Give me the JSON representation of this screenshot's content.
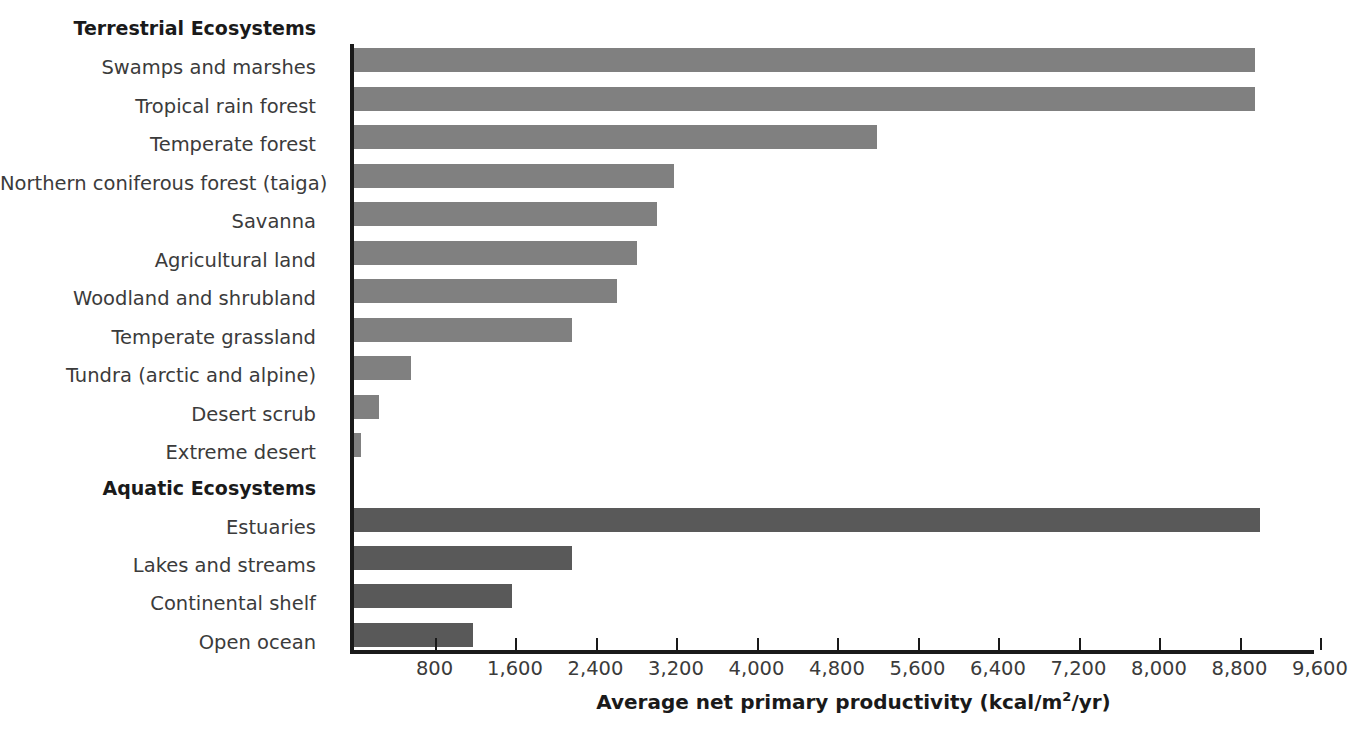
{
  "chart_data": {
    "type": "bar",
    "orientation": "horizontal",
    "title": "",
    "xlabel": "Average net primary productivity (kcal/m2/yr)",
    "xlabel_prefix": "Average net primary productivity (kcal/m",
    "xlabel_sup": "2",
    "xlabel_suffix": "/yr)",
    "ylabel": "",
    "xlim": [
      0,
      9600
    ],
    "grid": false,
    "legend": "none",
    "tick_values": [
      800,
      1600,
      2400,
      3200,
      4000,
      4800,
      5600,
      6400,
      7200,
      8000,
      8800,
      9600
    ],
    "tick_labels": [
      "800",
      "1,600",
      "2,400",
      "3,200",
      "4,000",
      "4,800",
      "5,600",
      "6,400",
      "7,200",
      "8,000",
      "8,800",
      "9,600"
    ],
    "groups": [
      {
        "name": "Terrestrial Ecosystems",
        "color": "#808080",
        "categories": [
          "Swamps and marshes",
          "Tropical rain forest",
          "Temperate forest",
          "Northern coniferous forest (taiga)",
          "Savanna",
          "Agricultural land",
          "Woodland and shrubland",
          "Temperate grassland",
          "Tundra (arctic and alpine)",
          "Desert scrub",
          "Extreme desert"
        ],
        "values": [
          8950,
          8950,
          5200,
          3180,
          3010,
          2810,
          2615,
          2170,
          570,
          250,
          70
        ]
      },
      {
        "name": "Aquatic Ecosystems",
        "color": "#595959",
        "categories": [
          "Estuaries",
          "Lakes and streams",
          "Continental shelf",
          "Open ocean"
        ],
        "values": [
          9000,
          2170,
          1570,
          1180
        ]
      }
    ],
    "categories": [
      "Swamps and marshes",
      "Tropical rain forest",
      "Temperate forest",
      "Northern coniferous forest (taiga)",
      "Savanna",
      "Agricultural land",
      "Woodland and shrubland",
      "Temperate grassland",
      "Tundra (arctic and alpine)",
      "Desert scrub",
      "Extreme desert",
      "Estuaries",
      "Lakes and streams",
      "Continental shelf",
      "Open ocean"
    ],
    "values": [
      8950,
      8950,
      5200,
      3180,
      3010,
      2810,
      2615,
      2170,
      570,
      250,
      70,
      9000,
      2170,
      1570,
      1180
    ]
  },
  "rows": [
    {
      "label": "Terrestrial Ecosystems",
      "kind": "header",
      "top": 18
    },
    {
      "label": "Swamps and marshes",
      "kind": "bar",
      "top": 58,
      "bar_top": 48,
      "value": 8950,
      "series": "terrestrial"
    },
    {
      "label": "Tropical rain forest",
      "kind": "bar",
      "top": 97,
      "bar_top": 87,
      "value": 8950,
      "series": "terrestrial"
    },
    {
      "label": "Temperate forest",
      "kind": "bar",
      "top": 135,
      "bar_top": 125,
      "value": 5200,
      "series": "terrestrial"
    },
    {
      "label": "Northern coniferous forest (taiga)",
      "kind": "bar",
      "top": 174,
      "bar_top": 164,
      "value": 3180,
      "series": "terrestrial"
    },
    {
      "label": "Savanna",
      "kind": "bar",
      "top": 212,
      "bar_top": 202,
      "value": 3010,
      "series": "terrestrial"
    },
    {
      "label": "Agricultural land",
      "kind": "bar",
      "top": 251,
      "bar_top": 241,
      "value": 2810,
      "series": "terrestrial"
    },
    {
      "label": "Woodland and shrubland",
      "kind": "bar",
      "top": 289,
      "bar_top": 279,
      "value": 2615,
      "series": "terrestrial"
    },
    {
      "label": "Temperate grassland",
      "kind": "bar",
      "top": 328,
      "bar_top": 318,
      "value": 2170,
      "series": "terrestrial"
    },
    {
      "label": "Tundra (arctic and alpine)",
      "kind": "bar",
      "top": 366,
      "bar_top": 356,
      "value": 570,
      "series": "terrestrial"
    },
    {
      "label": "Desert scrub",
      "kind": "bar",
      "top": 405,
      "bar_top": 395,
      "value": 250,
      "series": "terrestrial"
    },
    {
      "label": "Extreme desert",
      "kind": "bar",
      "top": 443,
      "bar_top": 433,
      "value": 70,
      "series": "terrestrial"
    },
    {
      "label": "Aquatic Ecosystems",
      "kind": "header",
      "top": 478
    },
    {
      "label": "Estuaries",
      "kind": "bar",
      "top": 518,
      "bar_top": 508,
      "value": 9000,
      "series": "aquatic"
    },
    {
      "label": "Lakes and streams",
      "kind": "bar",
      "top": 556,
      "bar_top": 546,
      "value": 2170,
      "series": "aquatic"
    },
    {
      "label": "Continental shelf",
      "kind": "bar",
      "top": 594,
      "bar_top": 584,
      "value": 1570,
      "series": "aquatic"
    },
    {
      "label": "Open ocean",
      "kind": "bar",
      "top": 633,
      "bar_top": 623,
      "value": 1180,
      "series": "aquatic"
    }
  ],
  "colors": {
    "terrestrial_bar": "#808080",
    "aquatic_bar": "#595959",
    "axis": "#1a1a1a",
    "label_text": "#3b3b3b",
    "background": "#ffffff"
  },
  "scale": {
    "origin_px": 354,
    "px_per_unit": 0.100625,
    "max_value": 9600
  }
}
